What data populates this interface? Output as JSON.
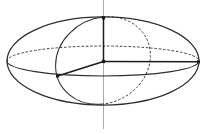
{
  "figure": {
    "canvas": {
      "width": 206,
      "height": 134
    },
    "colors": {
      "background": "#ffffff",
      "curve": "#2e2e2e",
      "dashed_curve": "#3a3a3a",
      "axis": "#1c1c1c",
      "guide_line": "#ababab",
      "marker": "#1a1a1a"
    },
    "stroke_widths": {
      "outline": 1.25,
      "equator": 1.05,
      "meridian": 1.05,
      "dashed": 1.0,
      "axis": 1.5,
      "guide": 1.0
    },
    "dash_pattern": "2.5 1.8",
    "vertical_guide_line": {
      "name": "vertical-guide-line",
      "x": 103.5,
      "y1": 0,
      "y2": 129
    },
    "outline_ellipse": {
      "name": "ellipsoid-outline",
      "cx": 103,
      "cy": 61,
      "rx": 96,
      "ry": 44
    },
    "equator_ellipse": {
      "cx": 103,
      "cy": 61,
      "rx": 96,
      "ry": 15,
      "front_name": "equator-front-solid-arc",
      "back_name": "equator-back-dashed-arc"
    },
    "meridian_ellipse": {
      "top": [
        103,
        17
      ],
      "bottom": [
        103,
        104
      ],
      "rx": 48.7,
      "ry": 42.3,
      "rotation": -27.7,
      "front_name": "meridian-front-solid-arc",
      "back_name": "meridian-back-dashed-arc"
    },
    "axes": [
      {
        "name": "semi-axis-vertical",
        "from": [
          103.5,
          61.5
        ],
        "to": [
          103.5,
          17.8
        ]
      },
      {
        "name": "semi-axis-right",
        "from": [
          103.5,
          61.5
        ],
        "to": [
          198.5,
          61.8
        ]
      },
      {
        "name": "semi-axis-front",
        "from": [
          103.5,
          61.5
        ],
        "to": [
          57.5,
          76.0
        ]
      }
    ],
    "markers": [
      {
        "name": "marker-north-pole",
        "x": 103.5,
        "y": 17.8,
        "size": 3.2
      },
      {
        "name": "marker-center",
        "x": 103.5,
        "y": 61.5,
        "size": 3.2
      },
      {
        "name": "marker-front-endpoint",
        "x": 57.5,
        "y": 76.0,
        "size": 3.0
      },
      {
        "name": "marker-right-endpoint",
        "x": 198.5,
        "y": 61.8,
        "size": 3.0
      }
    ]
  }
}
